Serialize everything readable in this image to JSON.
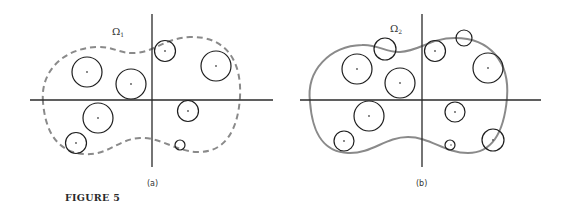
{
  "figure": {
    "caption": "FIGURE 5",
    "panels": [
      {
        "id": "a",
        "label": "(a)",
        "omega": "Ω",
        "omega_sub": "1",
        "boundary_style": "dashed",
        "boundary_color": "#8a8a8a"
      },
      {
        "id": "b",
        "label": "(b)",
        "omega": "Ω",
        "omega_sub": "2",
        "boundary_style": "solid",
        "boundary_color": "#8a8a8a"
      }
    ]
  }
}
